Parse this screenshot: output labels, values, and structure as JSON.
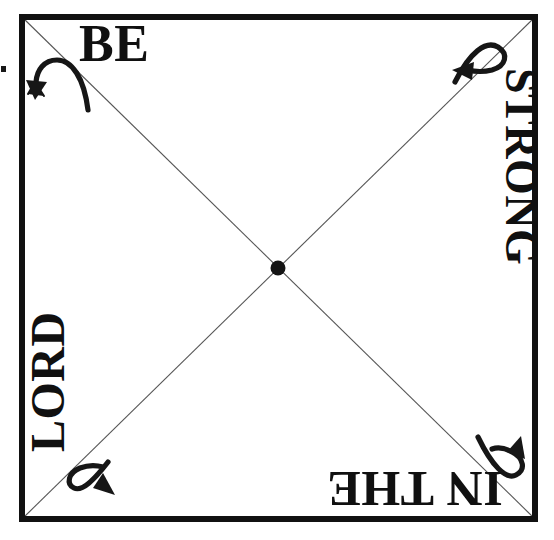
{
  "diagram": {
    "title": "BE STRONG IN THE LORD",
    "background_color": "#ffffff",
    "ink_color": "#101010",
    "diagonal_color": "#4a4a4a",
    "frame": {
      "x": 19,
      "y": 14,
      "width": 519,
      "height": 508,
      "stroke_width": 6
    },
    "center_dot": {
      "cx": 278,
      "cy": 268,
      "r": 7
    },
    "phrase_words": [
      {
        "id": "be",
        "label": "BE",
        "edge": "top",
        "rotation_deg": 0
      },
      {
        "id": "strong",
        "label": "STRONG",
        "edge": "right",
        "rotation_deg": 90
      },
      {
        "id": "inthe",
        "label": "IN THE",
        "edge": "bottom",
        "rotation_deg": 180
      },
      {
        "id": "lord",
        "label": "LORD",
        "edge": "left",
        "rotation_deg": 270
      }
    ],
    "rotation_arrows": [
      {
        "id": "top-left",
        "corner": "top-left",
        "points": "down-left"
      },
      {
        "id": "top-right",
        "corner": "top-right",
        "points": "left"
      },
      {
        "id": "bottom-right",
        "corner": "bottom-right",
        "points": "up"
      },
      {
        "id": "bottom-left",
        "corner": "bottom-left",
        "points": "right"
      }
    ],
    "edge_mark": {
      "x": 1,
      "y": 66,
      "width": 5,
      "height": 6
    }
  }
}
